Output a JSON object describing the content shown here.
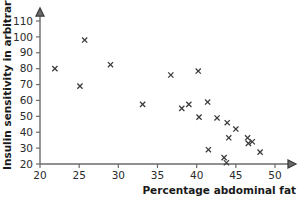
{
  "chart_data": {
    "type": "scatter",
    "title": "",
    "xlabel": "Percentage abdominal fat",
    "ylabel": "Insulin sensitivity in arbitrary units",
    "xlim": [
      20,
      51.5
    ],
    "ylim": [
      20,
      115
    ],
    "xticks": [
      20,
      25,
      30,
      35,
      40,
      45,
      50
    ],
    "xtick_labels": [
      "20",
      "25",
      "30",
      "35",
      "40",
      "45",
      "50"
    ],
    "yticks": [
      20,
      30,
      40,
      50,
      60,
      70,
      80,
      90,
      100,
      110
    ],
    "ytick_labels": [
      "20",
      "30",
      "40",
      "50",
      "60",
      "70",
      "80",
      "90",
      "100",
      "110"
    ],
    "grid": false,
    "legend": null,
    "marker": "x",
    "marker_color": "#3a3a3a",
    "points": [
      {
        "x": 21.9,
        "y": 80.0
      },
      {
        "x": 25.1,
        "y": 69.0
      },
      {
        "x": 25.7,
        "y": 98.0
      },
      {
        "x": 29.0,
        "y": 82.5
      },
      {
        "x": 33.1,
        "y": 57.5
      },
      {
        "x": 36.7,
        "y": 76.0
      },
      {
        "x": 38.1,
        "y": 55.0
      },
      {
        "x": 39.0,
        "y": 57.5
      },
      {
        "x": 40.2,
        "y": 78.5
      },
      {
        "x": 40.3,
        "y": 49.5
      },
      {
        "x": 41.4,
        "y": 59.0
      },
      {
        "x": 41.5,
        "y": 29.0
      },
      {
        "x": 42.6,
        "y": 49.0
      },
      {
        "x": 43.5,
        "y": 24.0
      },
      {
        "x": 43.8,
        "y": 20.8
      },
      {
        "x": 43.9,
        "y": 46.0
      },
      {
        "x": 44.1,
        "y": 36.5
      },
      {
        "x": 45.0,
        "y": 42.0
      },
      {
        "x": 46.5,
        "y": 36.5
      },
      {
        "x": 46.6,
        "y": 33.0
      },
      {
        "x": 47.1,
        "y": 34.0
      },
      {
        "x": 48.1,
        "y": 27.5
      }
    ]
  },
  "axes": {
    "x_arrow": "arrow-right",
    "y_arrow": "arrow-up"
  }
}
